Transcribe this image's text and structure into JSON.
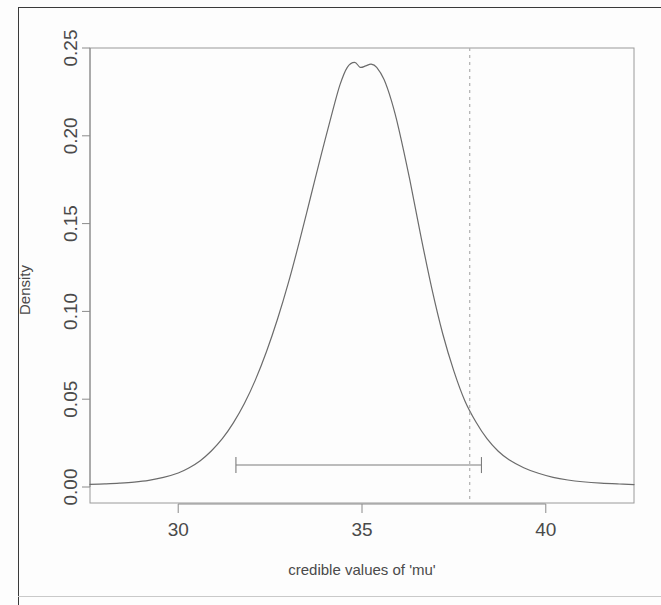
{
  "figure": {
    "kind": "density-posterior-plot",
    "background_color": "#fdfdfd",
    "line_color": "#6b6b6b",
    "axis_color": "#8a8a8a",
    "text_color": "#4a4a4a"
  },
  "chart_data": {
    "type": "line",
    "title": "",
    "subtitle": "",
    "xlabel": "credible values of 'mu'",
    "ylabel": "Density",
    "xlim": [
      27.6,
      42.4
    ],
    "ylim": [
      0.0,
      0.25
    ],
    "grid": false,
    "legend": null,
    "x_ticks": [
      30,
      35,
      40
    ],
    "x_tick_labels": [
      "30",
      "35",
      "40"
    ],
    "y_ticks": [
      0.0,
      0.05,
      0.1,
      0.15,
      0.2,
      0.25
    ],
    "y_tick_labels": [
      "0.00",
      "0.05",
      "0.10",
      "0.15",
      "0.20",
      "0.25"
    ],
    "series": [
      {
        "name": "posterior density of mu",
        "x": [
          27.6,
          28.0,
          28.4,
          28.8,
          29.2,
          29.6,
          30.0,
          30.3,
          30.6,
          30.9,
          31.2,
          31.5,
          31.8,
          32.1,
          32.4,
          32.7,
          33.0,
          33.3,
          33.6,
          33.9,
          34.2,
          34.4,
          34.6,
          34.8,
          34.95,
          35.1,
          35.25,
          35.4,
          35.6,
          35.8,
          36.0,
          36.3,
          36.6,
          36.9,
          37.2,
          37.5,
          37.8,
          38.1,
          38.4,
          38.7,
          39.0,
          39.4,
          39.8,
          40.2,
          40.6,
          41.0,
          41.5,
          42.0,
          42.4
        ],
        "y": [
          0.0015,
          0.0018,
          0.0022,
          0.0028,
          0.0038,
          0.0055,
          0.008,
          0.011,
          0.015,
          0.0205,
          0.0275,
          0.0365,
          0.0475,
          0.061,
          0.077,
          0.0955,
          0.1165,
          0.14,
          0.165,
          0.19,
          0.214,
          0.229,
          0.239,
          0.2418,
          0.239,
          0.2398,
          0.2408,
          0.239,
          0.232,
          0.22,
          0.204,
          0.175,
          0.143,
          0.113,
          0.087,
          0.066,
          0.049,
          0.037,
          0.0275,
          0.0205,
          0.0155,
          0.011,
          0.0078,
          0.0055,
          0.004,
          0.003,
          0.0022,
          0.0017,
          0.0014
        ]
      }
    ],
    "annotations": [
      {
        "kind": "hdi-interval-bar",
        "y_value": 0.0125,
        "x_start": 31.57,
        "x_end": 38.25,
        "label": ""
      },
      {
        "kind": "vertical-reference-line",
        "x_value": 37.93,
        "style": "dashed",
        "label": ""
      }
    ]
  }
}
